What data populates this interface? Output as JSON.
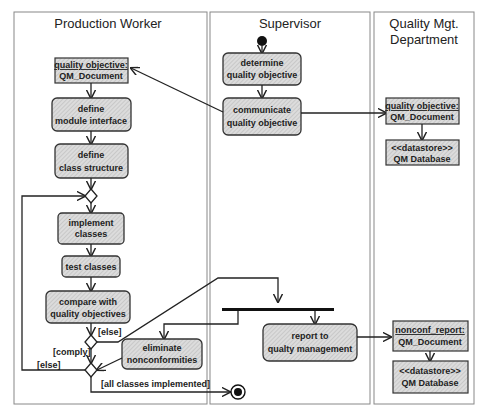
{
  "swimlanes": [
    {
      "id": "production-worker",
      "title": [
        "Production Worker"
      ]
    },
    {
      "id": "supervisor",
      "title": [
        "Supervisor"
      ]
    },
    {
      "id": "quality-dept",
      "title": [
        "Quality Mgt.",
        "Department"
      ]
    }
  ],
  "activities": {
    "determine": [
      "determine",
      "quality objective"
    ],
    "communicate": [
      "communicate",
      "quality objective"
    ],
    "define_module": [
      "define",
      "module interface"
    ],
    "define_class": [
      "define",
      "class structure"
    ],
    "implement": [
      "implement",
      "classes"
    ],
    "test": [
      "test classes"
    ],
    "compare": [
      "compare with",
      "quality objectives"
    ],
    "eliminate": [
      "eliminate",
      "nonconformities"
    ],
    "report": [
      "report to",
      "qualty management"
    ]
  },
  "objects": {
    "qo_worker": {
      "name": "quality objective:",
      "type": "QM_Document"
    },
    "qo_dept": {
      "name": "quality objective:",
      "type": "QM_Document"
    },
    "datastore1": {
      "name": "<<datastore>>",
      "type": "QM Database"
    },
    "nonconf": {
      "name": "nonconf_report:",
      "type": "QM_Document"
    },
    "datastore2": {
      "name": "<<datastore>>",
      "type": "QM Database"
    }
  },
  "guards": {
    "else_top": "[else]",
    "comply": "[comply]",
    "else_loop": "[else]",
    "all_done": "[all classes implemented]"
  },
  "colors": {
    "fill": "#d4d4d4",
    "hatch": "#b8b8b8",
    "line": "#222222",
    "lane_border": "#888888"
  }
}
